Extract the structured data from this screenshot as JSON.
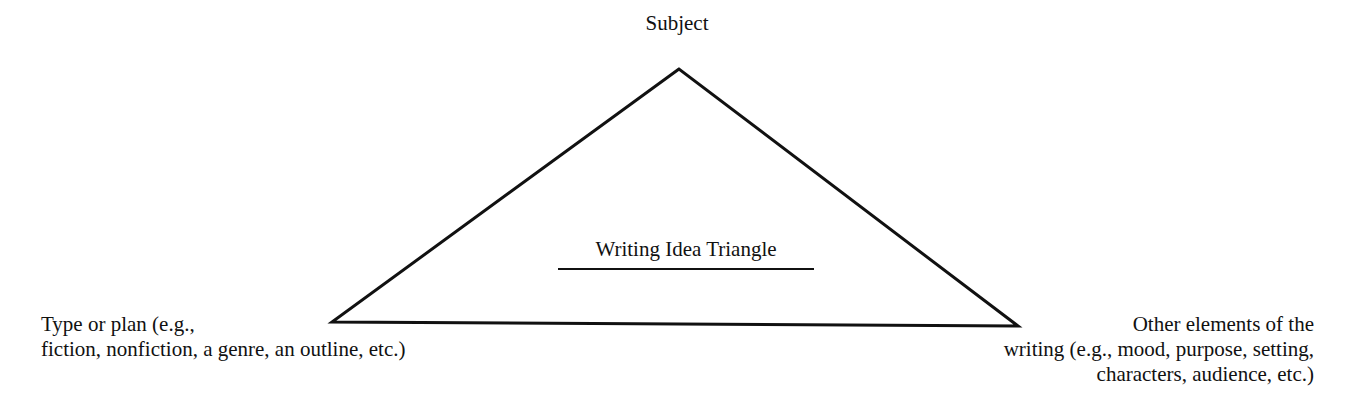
{
  "diagram": {
    "title": "Writing Idea Triangle",
    "vertices": {
      "top": {
        "label": "Subject"
      },
      "left": {
        "lines": [
          "Type or plan (e.g.,",
          "fiction, nonfiction, a genre, an outline, etc.)"
        ]
      },
      "right": {
        "lines": [
          "Other elements of the",
          "writing (e.g., mood, purpose, setting,",
          "characters, audience, etc.)"
        ]
      }
    },
    "colors": {
      "stroke": "#111111",
      "background": "#ffffff"
    }
  }
}
